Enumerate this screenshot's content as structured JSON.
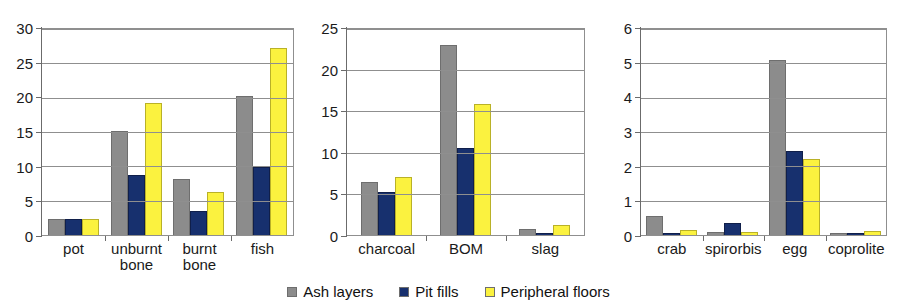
{
  "legend": {
    "position": "bottom-center",
    "items": [
      {
        "label": "Ash layers",
        "color": "#8c8c8c"
      },
      {
        "label": "Pit fills",
        "color": "#17306e"
      },
      {
        "label": "Peripheral floors",
        "color": "#fbf23f"
      }
    ]
  },
  "chart_data": [
    {
      "type": "bar",
      "title": "",
      "xlabel": "",
      "ylabel": "",
      "ylim": [
        0,
        30
      ],
      "yticks": [
        0,
        5,
        10,
        15,
        20,
        25,
        30
      ],
      "ytick_labels": [
        "0",
        "5",
        "10",
        "15",
        "20",
        "25",
        "30"
      ],
      "grid": true,
      "categories": [
        "pot",
        "unburnt\nbone",
        "burnt\nbone",
        "fish"
      ],
      "series": [
        {
          "name": "Ash layers",
          "color": "#8c8c8c",
          "values": [
            2.4,
            15.1,
            8.2,
            20.3
          ]
        },
        {
          "name": "Pit fills",
          "color": "#17306e",
          "values": [
            2.4,
            8.8,
            3.5,
            9.9
          ]
        },
        {
          "name": "Peripheral floors",
          "color": "#fbf23f",
          "values": [
            2.3,
            19.2,
            6.2,
            27.3
          ]
        }
      ]
    },
    {
      "type": "bar",
      "title": "",
      "xlabel": "",
      "ylabel": "",
      "ylim": [
        0,
        25
      ],
      "yticks": [
        0,
        5,
        10,
        15,
        20,
        25
      ],
      "ytick_labels": [
        "0",
        "5",
        "10",
        "15",
        "20",
        "25"
      ],
      "grid": true,
      "categories": [
        "charcoal",
        "BOM",
        "slag"
      ],
      "series": [
        {
          "name": "Ash layers",
          "color": "#8c8c8c",
          "values": [
            6.4,
            23.0,
            0.7
          ]
        },
        {
          "name": "Pit fills",
          "color": "#17306e",
          "values": [
            5.2,
            10.6,
            0.2
          ]
        },
        {
          "name": "Peripheral floors",
          "color": "#fbf23f",
          "values": [
            7.0,
            15.9,
            1.2
          ]
        }
      ]
    },
    {
      "type": "bar",
      "title": "",
      "xlabel": "",
      "ylabel": "",
      "ylim": [
        0,
        6
      ],
      "yticks": [
        0,
        1,
        2,
        3,
        4,
        5,
        6
      ],
      "ytick_labels": [
        "0",
        "1",
        "2",
        "3",
        "4",
        "5",
        "6"
      ],
      "grid": true,
      "categories": [
        "crab",
        "spirorbis",
        "egg",
        "coprolite"
      ],
      "series": [
        {
          "name": "Ash layers",
          "color": "#8c8c8c",
          "values": [
            0.55,
            0.08,
            5.1,
            0.06
          ]
        },
        {
          "name": "Pit fills",
          "color": "#17306e",
          "values": [
            0.03,
            0.35,
            2.45,
            0.02
          ]
        },
        {
          "name": "Peripheral floors",
          "color": "#fbf23f",
          "values": [
            0.15,
            0.08,
            2.2,
            0.13
          ]
        }
      ]
    }
  ]
}
